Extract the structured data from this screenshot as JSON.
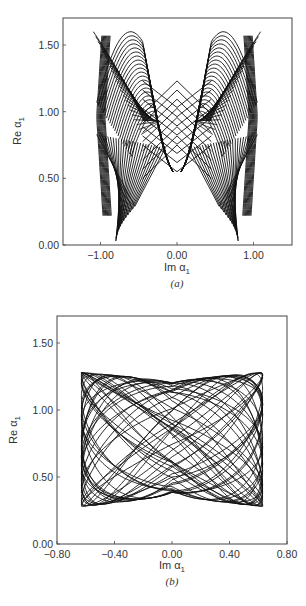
{
  "chart_data": [
    {
      "type": "line",
      "panel_label": "(a)",
      "title": "",
      "xlabel": "Im α1",
      "ylabel": "Re α1",
      "xlim": [
        -1.5,
        1.5
      ],
      "ylim": [
        0.0,
        1.7
      ],
      "xticks": [
        -1.0,
        0.0,
        1.0
      ],
      "xtick_labels": [
        "-1.00",
        "0.00",
        "1.00"
      ],
      "yticks": [
        0.0,
        0.5,
        1.0,
        1.5
      ],
      "ytick_labels": [
        "0.00",
        "0.50",
        "1.00",
        "1.50"
      ],
      "grid": false,
      "legend": null,
      "description": "Dense quasi-periodic phase-space trajectory forming a butterfly/bow-tie shaped mesh, symmetric about Im α1 = 0; lobes reach Re α1 ≈ 1.60 at Im α1 ≈ ±0.7, lower cusps near Re α1 ≈ 0.02 at Im α1 ≈ ±0.65, outer edges at Im α1 ≈ ±1.05, central diamond spanning Re α1 ≈ 0.55–1.10",
      "envelope": {
        "im_max": 1.05,
        "re_top": 1.6,
        "re_bottom": 0.02,
        "center_re_min": 0.55,
        "center_re_max": 1.1,
        "waist_re": 0.83
      }
    },
    {
      "type": "line",
      "panel_label": "(b)",
      "title": "",
      "xlabel": "Im α1",
      "ylabel": "Re α1",
      "xlim": [
        -0.8,
        0.8
      ],
      "ylim": [
        0.0,
        1.7
      ],
      "xticks": [
        -0.8,
        -0.4,
        0.0,
        0.4,
        0.8
      ],
      "xtick_labels": [
        "-0.80",
        "-0.40",
        "0.00",
        "0.40",
        "0.80"
      ],
      "yticks": [
        0.0,
        0.5,
        1.0,
        1.5
      ],
      "ytick_labels": [
        "0.00",
        "0.50",
        "1.00",
        "1.50"
      ],
      "grid": false,
      "legend": null,
      "description": "Dense quasi-periodic trajectory filling a roughly rectangular region with concave top and bottom edges; Im α1 from ≈ -0.63 to 0.63, Re α1 from ≈ 0.28 to 1.28, dipping to ≈ 1.20 top-center and rising to ≈ 0.38 bottom-center",
      "envelope": {
        "im_max": 0.63,
        "re_top_edge": 1.28,
        "re_top_center": 1.2,
        "re_bottom_edge": 0.28,
        "re_bottom_center": 0.38
      }
    }
  ],
  "panels": {
    "a": {
      "ylabel_text": "Re α",
      "ylabel_sub": "1",
      "xlabel_text": "Im α",
      "xlabel_sub": "1",
      "caption": "(a)"
    },
    "b": {
      "ylabel_text": "Re α",
      "ylabel_sub": "1",
      "xlabel_text": "Im α",
      "xlabel_sub": "1",
      "caption": "(b)"
    }
  }
}
